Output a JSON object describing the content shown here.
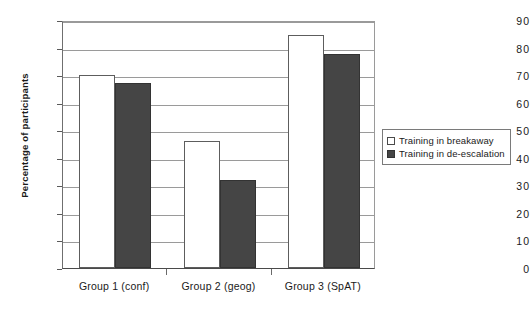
{
  "chart_data": {
    "type": "bar",
    "title": "",
    "xlabel": "",
    "ylabel": "Percentage of participants",
    "categories": [
      "Group 1 (conf)",
      "Group 2 (geog)",
      "Group 3 (SpAT)"
    ],
    "series": [
      {
        "name": "Training  in  breakaway",
        "values": [
          70,
          46,
          84.5
        ],
        "color": "#ffffff"
      },
      {
        "name": "Training  in  de-escalation",
        "values": [
          67,
          32,
          77.5
        ],
        "color": "#454545"
      }
    ],
    "ylim": [
      0,
      90
    ],
    "ytick_labels": [
      "0",
      "10",
      "20",
      "30",
      "40",
      "50",
      "60",
      "70",
      "80",
      "90"
    ],
    "ytick_values": [
      0,
      10,
      20,
      30,
      40,
      50,
      60,
      70,
      80,
      90
    ],
    "grid": true,
    "legend_position": "right"
  },
  "legend": {
    "entries": [
      {
        "label": "Training  in  breakaway",
        "swatch": "open-square-swatch"
      },
      {
        "label": "Training  in  de-escalation",
        "swatch": "filled-square-swatch"
      }
    ]
  }
}
